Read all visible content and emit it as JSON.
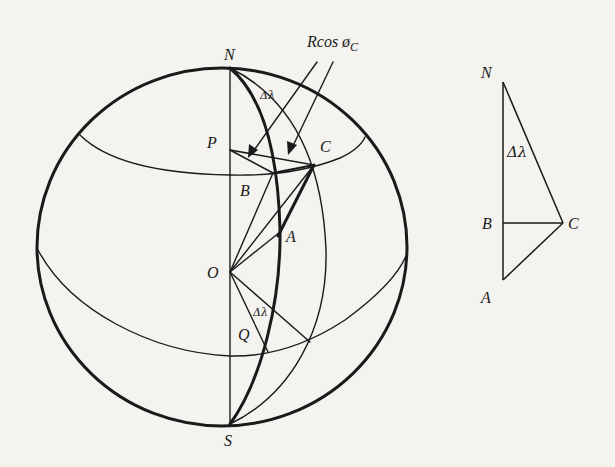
{
  "figure": {
    "colors": {
      "ink": "#1a1a1a",
      "paper": "#f4f3f0"
    },
    "globe": {
      "labels": {
        "north": "N",
        "south": "S",
        "center": "O",
        "p": "P",
        "b": "B",
        "c": "C",
        "a": "A",
        "q": "Q",
        "delta_lambda_top": "Δλ",
        "delta_lambda_bottom": "Δλ"
      },
      "annotation": {
        "main": "Rcos ø",
        "subscript": "C"
      }
    },
    "triangle": {
      "labels": {
        "n": "N",
        "b": "B",
        "c": "C",
        "a": "A",
        "angle": "Δλ"
      }
    }
  }
}
